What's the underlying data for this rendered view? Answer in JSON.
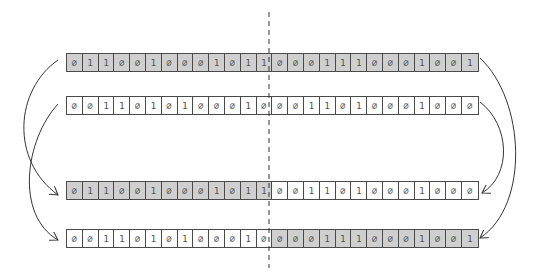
{
  "diagram": {
    "type": "single-point crossover of two bit strings",
    "split_index": 13,
    "colors": {
      "parent_a": "#cfcfcf",
      "parent_b": "#ffffff",
      "border": "#4a4a4a",
      "arrow": "#333333"
    },
    "zero_glyph": "∅",
    "rows": [
      {
        "id": "parent-a",
        "bits": [
          "0",
          "1",
          "1",
          "0",
          "0",
          "1",
          "0",
          "0",
          "0",
          "1",
          "0",
          "1",
          "1",
          "0",
          "0",
          "0",
          "1",
          "1",
          "1",
          "0",
          "0",
          "0",
          "1",
          "0",
          "0",
          "1"
        ],
        "shade": [
          "g",
          "g",
          "g",
          "g",
          "g",
          "g",
          "g",
          "g",
          "g",
          "g",
          "g",
          "g",
          "g",
          "g",
          "g",
          "g",
          "g",
          "g",
          "g",
          "g",
          "g",
          "g",
          "g",
          "g",
          "g",
          "g"
        ]
      },
      {
        "id": "parent-b",
        "bits": [
          "0",
          "0",
          "1",
          "1",
          "0",
          "1",
          "0",
          "1",
          "0",
          "0",
          "0",
          "1",
          "0",
          "0",
          "0",
          "1",
          "1",
          "0",
          "1",
          "0",
          "0",
          "0",
          "1",
          "0",
          "0",
          "0"
        ],
        "shade": [
          "w",
          "w",
          "w",
          "w",
          "w",
          "w",
          "w",
          "w",
          "w",
          "w",
          "w",
          "w",
          "w",
          "w",
          "w",
          "w",
          "w",
          "w",
          "w",
          "w",
          "w",
          "w",
          "w",
          "w",
          "w",
          "w"
        ]
      },
      {
        "id": "child-1",
        "bits": [
          "0",
          "1",
          "1",
          "0",
          "0",
          "1",
          "0",
          "0",
          "0",
          "1",
          "0",
          "1",
          "1",
          "0",
          "0",
          "1",
          "1",
          "0",
          "1",
          "0",
          "0",
          "0",
          "1",
          "0",
          "0",
          "0"
        ],
        "shade": [
          "g",
          "g",
          "g",
          "g",
          "g",
          "g",
          "g",
          "g",
          "g",
          "g",
          "g",
          "g",
          "g",
          "w",
          "w",
          "w",
          "w",
          "w",
          "w",
          "w",
          "w",
          "w",
          "w",
          "w",
          "w",
          "w"
        ]
      },
      {
        "id": "child-2",
        "bits": [
          "0",
          "0",
          "1",
          "1",
          "0",
          "1",
          "0",
          "1",
          "0",
          "0",
          "0",
          "1",
          "0",
          "0",
          "0",
          "0",
          "1",
          "1",
          "1",
          "0",
          "0",
          "0",
          "1",
          "0",
          "0",
          "1"
        ],
        "shade": [
          "w",
          "w",
          "w",
          "w",
          "w",
          "w",
          "w",
          "w",
          "w",
          "w",
          "w",
          "w",
          "w",
          "g",
          "g",
          "g",
          "g",
          "g",
          "g",
          "g",
          "g",
          "g",
          "g",
          "g",
          "g",
          "g"
        ]
      }
    ],
    "arrows": [
      {
        "from": "parent-a-left",
        "to": "child-1-left"
      },
      {
        "from": "parent-b-left",
        "to": "child-2-left"
      },
      {
        "from": "parent-a-right",
        "to": "child-2-right"
      },
      {
        "from": "parent-b-right",
        "to": "child-1-right"
      }
    ]
  }
}
